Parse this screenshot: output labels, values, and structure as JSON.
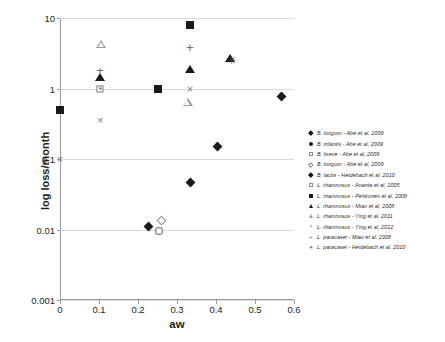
{
  "chart_data": {
    "type": "scatter",
    "title": "",
    "xlabel": "aw",
    "ylabel": "log loss/month",
    "xlim": [
      0,
      0.6
    ],
    "ylim": [
      0.001,
      10
    ],
    "yscale": "log",
    "xticks": [
      "0",
      "0.1",
      "0.2",
      "0.3",
      "0.4",
      "0.5",
      "0.6"
    ],
    "xtick_values": [
      0,
      0.1,
      0.2,
      0.3,
      0.4,
      0.5,
      0.6
    ],
    "yticks": [
      "10",
      "1",
      "0.1",
      "0.01",
      "0.001"
    ],
    "ytick_values": [
      10,
      1,
      0.1,
      0.01,
      0.001
    ],
    "grid": "horizontal",
    "legend_position": "right",
    "series": [
      {
        "name": "B. longum - Abe et al, 2009",
        "marker": "diamond-filled",
        "points": [
          {
            "x": 0.395,
            "y": 0.17
          },
          {
            "x": 0.56,
            "y": 0.85
          },
          {
            "x": 0.325,
            "y": 0.052
          }
        ]
      },
      {
        "name": "B. infantis - Abe et al, 2009",
        "marker": "circle-filled",
        "points": [
          {
            "x": 0.253,
            "y": 0.0095
          }
        ]
      },
      {
        "name": "B. breve - Abe et al, 2009",
        "marker": "square-open",
        "points": [
          {
            "x": 0.253,
            "y": 0.0095
          }
        ]
      },
      {
        "name": "B. longum - Abe et al, 2009",
        "marker": "diamond-open",
        "points": [
          {
            "x": 0.251,
            "y": 0.0152
          }
        ]
      },
      {
        "name": "B. lactis - Heidebach et al, 2010",
        "marker": "diamond-filled-small",
        "points": [
          {
            "x": 0.218,
            "y": 0.0122
          }
        ]
      },
      {
        "name": "L. rhamnosus - Ananta et al, 2005",
        "marker": "square-dotted",
        "points": [
          {
            "x": 0.103,
            "y": 1.0
          }
        ]
      },
      {
        "name": "L. rhamnosus - Pehkonen et al, 2008",
        "marker": "square-filled",
        "points": [
          {
            "x": 0.0,
            "y": 0.5
          },
          {
            "x": 0.252,
            "y": 1.0
          },
          {
            "x": 0.333,
            "y": 8.0
          }
        ]
      },
      {
        "name": "L. rhamnosus - Miao et al, 2008",
        "marker": "triangle-filled",
        "points": [
          {
            "x": 0.103,
            "y": 1.45
          },
          {
            "x": 0.333,
            "y": 1.9
          },
          {
            "x": 0.437,
            "y": 2.75
          }
        ]
      },
      {
        "name": "L. rhamnosus - Ying et al, 2011",
        "marker": "triangle-open",
        "points": [
          {
            "x": 0.105,
            "y": 5.4
          },
          {
            "x": 0.327,
            "y": 1.05
          }
        ]
      },
      {
        "name": "L. rhamnosus - Ying et al, 2012",
        "marker": "cross",
        "points": [
          {
            "x": 0.0,
            "y": 0.1
          },
          {
            "x": 0.103,
            "y": 0.36
          },
          {
            "x": 0.333,
            "y": 1.0
          }
        ]
      },
      {
        "name": "L. paracasei - Miao et al, 2008",
        "marker": "plus",
        "points": [
          {
            "x": 0.103,
            "y": 1.75
          },
          {
            "x": 0.333,
            "y": 3.8
          }
        ]
      },
      {
        "name": "L. paracasei - Heidebach et al, 2010",
        "marker": "asterisk",
        "points": [
          {
            "x": 0.44,
            "y": 2.55
          }
        ]
      }
    ]
  },
  "axes": {
    "x_label": "aw",
    "y_label": "log loss/month"
  },
  "legend": {
    "items": [
      {
        "label": "B. longum - Abe et al, 2009",
        "glyph": "lg-diam-f"
      },
      {
        "label": "B. infantis - Abe et al, 2009",
        "glyph": "lg-circ-f"
      },
      {
        "label": "B. breve - Abe et al, 2009",
        "glyph": "lg-sq-o"
      },
      {
        "label": "B. longum - Abe et al, 2009",
        "glyph": "lg-diam-o"
      },
      {
        "label": "B. lactis - Heidebach et al, 2010",
        "glyph": "lg-diam-f"
      },
      {
        "label": "L. rhamnosus - Ananta et al, 2005",
        "glyph": "lg-sq-o"
      },
      {
        "label": "L. rhamnosus - Pehkonen et al, 2008",
        "glyph": "lg-sq-f"
      },
      {
        "label": "L. rhamnosus - Miao et al, 2008",
        "glyph": "lg-tri-f"
      },
      {
        "label": "L. rhamnosus - Ying et al, 2011",
        "glyph": "lg-tri-o"
      },
      {
        "label": "L. rhamnosus - Ying et al, 2012",
        "glyph": "lg-cross"
      },
      {
        "label": "L. paracasei - Miao et al, 2008",
        "glyph": "lg-plus"
      },
      {
        "label": "L. paracasei - Heidebach et al, 2010",
        "glyph": "lg-star"
      }
    ]
  }
}
